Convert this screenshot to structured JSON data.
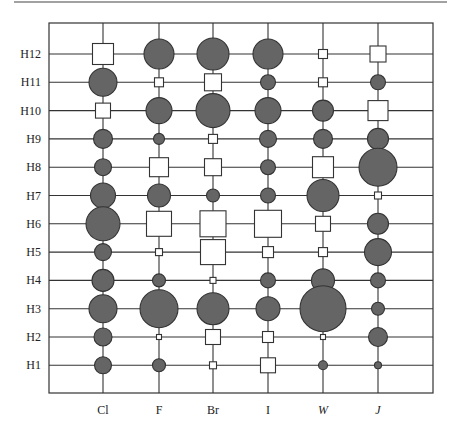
{
  "chart_data": {
    "type": "bubble-matrix",
    "title": "",
    "xlabel": "",
    "ylabel": "",
    "categories": [
      "Cl",
      "F",
      "Br",
      "I",
      "W",
      "J"
    ],
    "category_italic": [
      false,
      false,
      false,
      false,
      true,
      true
    ],
    "rows": [
      "H12",
      "H11",
      "H10",
      "H9",
      "H8",
      "H7",
      "H6",
      "H5",
      "H4",
      "H3",
      "H2",
      "H1"
    ],
    "legend": {
      "circle": "filled gray circle (positive)",
      "square": "open white square (negative)"
    },
    "grid": true,
    "colors": {
      "circle_fill": "#656565",
      "outline": "#333333",
      "square_fill": "#ffffff",
      "grid": "#333333"
    },
    "cells": {
      "H12": [
        [
          "square",
          21
        ],
        [
          "circle",
          30
        ],
        [
          "circle",
          32
        ],
        [
          "circle",
          30
        ],
        [
          "square",
          9
        ],
        [
          "square",
          16
        ]
      ],
      "H11": [
        [
          "circle",
          28
        ],
        [
          "square",
          9
        ],
        [
          "square",
          17
        ],
        [
          "circle",
          15
        ],
        [
          "square",
          9
        ],
        [
          "circle",
          15
        ]
      ],
      "H10": [
        [
          "square",
          15
        ],
        [
          "circle",
          26
        ],
        [
          "circle",
          34
        ],
        [
          "circle",
          26
        ],
        [
          "circle",
          21
        ],
        [
          "square",
          20
        ]
      ],
      "H9": [
        [
          "circle",
          19
        ],
        [
          "circle",
          11
        ],
        [
          "square",
          9
        ],
        [
          "circle",
          17
        ],
        [
          "circle",
          19
        ],
        [
          "circle",
          21
        ]
      ],
      "H8": [
        [
          "circle",
          17
        ],
        [
          "square",
          19
        ],
        [
          "square",
          17
        ],
        [
          "circle",
          15
        ],
        [
          "square",
          21
        ],
        [
          "circle",
          38
        ]
      ],
      "H7": [
        [
          "circle",
          25
        ],
        [
          "circle",
          23
        ],
        [
          "circle",
          13
        ],
        [
          "circle",
          15
        ],
        [
          "circle",
          32
        ],
        [
          "square",
          7
        ]
      ],
      "H6": [
        [
          "circle",
          34
        ],
        [
          "square",
          25
        ],
        [
          "square",
          26
        ],
        [
          "square",
          27
        ],
        [
          "square",
          15
        ],
        [
          "circle",
          21
        ]
      ],
      "H5": [
        [
          "circle",
          17
        ],
        [
          "square",
          7
        ],
        [
          "square",
          25
        ],
        [
          "square",
          11
        ],
        [
          "square",
          9
        ],
        [
          "circle",
          27
        ]
      ],
      "H4": [
        [
          "circle",
          22
        ],
        [
          "circle",
          13
        ],
        [
          "square",
          6
        ],
        [
          "circle",
          15
        ],
        [
          "circle",
          23
        ],
        [
          "circle",
          15
        ]
      ],
      "H3": [
        [
          "circle",
          28
        ],
        [
          "circle",
          38
        ],
        [
          "circle",
          32
        ],
        [
          "circle",
          24
        ],
        [
          "circle",
          46
        ],
        [
          "circle",
          13
        ]
      ],
      "H2": [
        [
          "circle",
          18
        ],
        [
          "square",
          5
        ],
        [
          "square",
          15
        ],
        [
          "square",
          11
        ],
        [
          "square",
          5
        ],
        [
          "circle",
          19
        ]
      ],
      "H1": [
        [
          "circle",
          17
        ],
        [
          "circle",
          13
        ],
        [
          "square",
          7
        ],
        [
          "square",
          15
        ],
        [
          "circle",
          9
        ],
        [
          "circle",
          7
        ]
      ]
    },
    "size_units": "marker diameter / side in pixels (relative magnitude)"
  }
}
